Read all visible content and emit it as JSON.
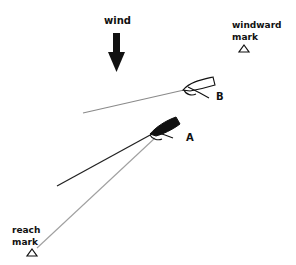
{
  "diagram": {
    "wind": {
      "label": "wind",
      "direction": "down"
    },
    "marks": [
      {
        "id": "windward",
        "line1": "windward",
        "line2": "mark"
      },
      {
        "id": "reach",
        "line1": "reach",
        "line2": "mark"
      }
    ],
    "boats": [
      {
        "id": "B",
        "label": "B",
        "hull": "outline",
        "wake": "gray"
      },
      {
        "id": "A",
        "label": "A",
        "hull": "filled",
        "wake": "black"
      }
    ],
    "course_line": {
      "from": "A",
      "to": "reach mark",
      "color": "#9a9a9a"
    },
    "colors": {
      "ink": "#111111",
      "wake_gray": "#8a8a8a",
      "course_gray": "#a0a0a0"
    }
  }
}
